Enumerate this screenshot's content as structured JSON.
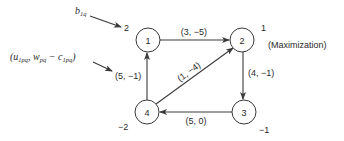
{
  "diagram": {
    "type": "network-flow",
    "mode_label": "(Maximization)",
    "nodes": [
      {
        "id": "1",
        "label": "1",
        "supply": "2"
      },
      {
        "id": "2",
        "label": "2",
        "supply": "1"
      },
      {
        "id": "3",
        "label": "3",
        "supply": "−1"
      },
      {
        "id": "4",
        "label": "4",
        "supply": "−2"
      }
    ],
    "edges": [
      {
        "from": "1",
        "to": "2",
        "label": "(3, −5)"
      },
      {
        "from": "2",
        "to": "3",
        "label": "(4, −1)"
      },
      {
        "from": "3",
        "to": "4",
        "label": "(5, 0)"
      },
      {
        "from": "4",
        "to": "1",
        "label": "(5, −1)"
      },
      {
        "from": "4",
        "to": "2",
        "label": "(1, −4)"
      }
    ],
    "annotations": {
      "supply_legend": "b",
      "supply_legend_sub": "1q",
      "edge_legend_parts": [
        "(u",
        "1pq",
        ", w",
        "pq",
        " − c",
        "1pq",
        ")"
      ]
    }
  }
}
